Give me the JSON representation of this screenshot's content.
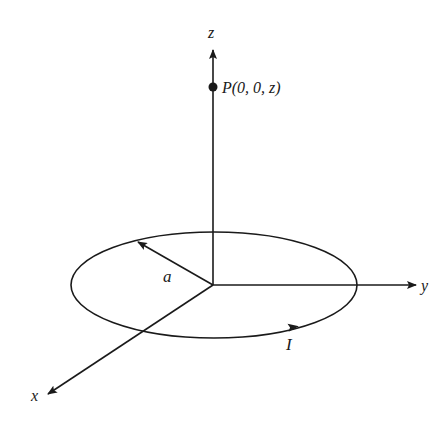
{
  "figure": {
    "axes": {
      "z_label": "z",
      "y_label": "y",
      "x_label": "x"
    },
    "point": {
      "label": "P(0, 0, z)"
    },
    "loop": {
      "radius_label": "a",
      "current_label": "I"
    },
    "colors": {
      "ink": "#1a1a1a",
      "background": "#ffffff"
    }
  }
}
